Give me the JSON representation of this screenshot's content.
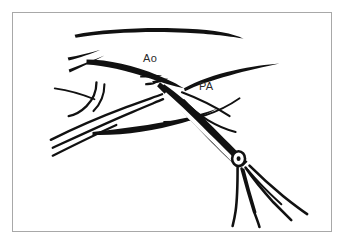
{
  "figure": {
    "kind": "surgical-line-drawing",
    "background_color": "#ffffff",
    "ink_color": "#111111",
    "frame": {
      "border_color": "#a8a8a8",
      "border_width_px": 1,
      "x": 12,
      "y": 12,
      "width": 320,
      "height": 220
    },
    "labels": [
      {
        "id": "ao",
        "text": "Ao",
        "meaning": "aorta",
        "x": 130,
        "y": 40
      },
      {
        "id": "pa",
        "text": "PA",
        "meaning": "pulmonary artery",
        "x": 186,
        "y": 68
      }
    ],
    "elements": [
      {
        "name": "aortic-arch-upper-contour",
        "type": "stroke"
      },
      {
        "name": "upper-left-short-strokes",
        "type": "stroke-pair"
      },
      {
        "name": "aorta-lower-contour",
        "type": "stroke"
      },
      {
        "name": "dissection-tick-marks",
        "type": "stroke-group",
        "count": 3
      },
      {
        "name": "pulmonary-artery-contour",
        "type": "stroke"
      },
      {
        "name": "left-vessel-bundle",
        "type": "stroke-group",
        "count": 4
      },
      {
        "name": "vessel-hook-loop",
        "type": "stroke"
      },
      {
        "name": "scissors-blades",
        "type": "stroke-group"
      },
      {
        "name": "scissors-hinge-screw",
        "type": "ring"
      },
      {
        "name": "scissors-shanks",
        "type": "stroke-group",
        "count": 4
      }
    ]
  }
}
